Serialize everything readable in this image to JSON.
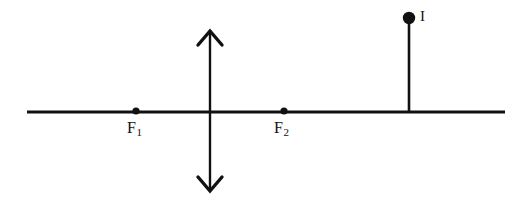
{
  "figure": {
    "background_color": "#ffffff",
    "stroke_color": "#111111",
    "width": 524,
    "height": 205
  },
  "optical_axis": {
    "name": "principal axis",
    "x_start": 27,
    "x_end": 505,
    "y": 112,
    "thickness": 3
  },
  "lens": {
    "name": "converging lens",
    "symbol": "double-headed vertical arrow",
    "x": 210,
    "y_top": 30,
    "y_bottom": 192,
    "thickness": 2,
    "arrowhead_style": "open chevron"
  },
  "focal_points": [
    {
      "id": "F1",
      "label": "F",
      "subscript": "1",
      "x": 136,
      "y": 111,
      "dot_radius": 3.6,
      "label_x": 127,
      "label_y": 120
    },
    {
      "id": "F2",
      "label": "F",
      "subscript": "2",
      "x": 284,
      "y": 111,
      "dot_radius": 3.6,
      "label_x": 274,
      "label_y": 120
    }
  ],
  "object": {
    "id": "I",
    "label": "I",
    "tip_x": 409,
    "tip_y": 18,
    "base_y": 112,
    "dot_radius": 6.2,
    "stem_thickness": 2.6,
    "label_x": 420,
    "label_y": 9
  }
}
